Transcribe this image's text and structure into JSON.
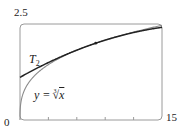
{
  "chart_data": {
    "type": "line",
    "title": "",
    "xlabel": "",
    "ylabel": "",
    "xlim": [
      0,
      15
    ],
    "ylim": [
      0,
      2.5
    ],
    "x_tick_labels": [
      "0",
      "15"
    ],
    "y_tick_labels": [
      "2.5"
    ],
    "minor_x_ticks": [
      3,
      6,
      9,
      12
    ],
    "grid": false,
    "legend": "none",
    "series": [
      {
        "name": "y = ∛x",
        "function": "cbrt(x)",
        "x": [
          0,
          0.125,
          0.5,
          1,
          2,
          3,
          4,
          5,
          6,
          7,
          8,
          9,
          10,
          11,
          12,
          13,
          14,
          15
        ],
        "values": [
          0,
          0.5,
          0.794,
          1,
          1.26,
          1.442,
          1.587,
          1.71,
          1.817,
          1.913,
          2,
          2.08,
          2.154,
          2.224,
          2.289,
          2.351,
          2.41,
          2.466
        ],
        "color": "#888888"
      },
      {
        "name": "T₂",
        "function": "2 + (x-8)/12 - (x-8)^2/288",
        "x": [
          0,
          1,
          2,
          3,
          4,
          5,
          6,
          7,
          8,
          9,
          10,
          11,
          12,
          13,
          14,
          15
        ],
        "values": [
          1.111,
          1.247,
          1.375,
          1.497,
          1.611,
          1.719,
          1.819,
          1.913,
          2,
          2.08,
          2.153,
          2.219,
          2.278,
          2.33,
          2.375,
          2.413
        ],
        "color": "#222222"
      }
    ],
    "annotations": [
      {
        "text": "T₂",
        "x": 1.1,
        "y": 1.55
      },
      {
        "text": "y = ∛x",
        "x": 5.5,
        "y": 0.85
      },
      {
        "text": "point of tangency",
        "x": 8,
        "y": 2
      }
    ]
  },
  "labels": {
    "y_max": "2.5",
    "x_min": "0",
    "x_max": "15",
    "t2_main": "T",
    "t2_sub": "2",
    "curve_prefix": "y = ",
    "curve_root_index": "3",
    "curve_root": "√",
    "curve_var": "x"
  },
  "colors": {
    "frame": "#9a9a9a",
    "curve": "#8a8a8a",
    "taylor": "#222222"
  }
}
